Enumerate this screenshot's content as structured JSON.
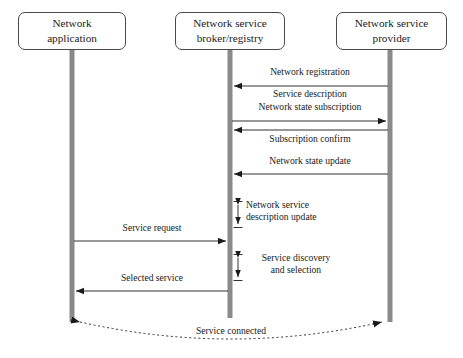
{
  "diagram": {
    "type": "sequence-diagram",
    "title": "",
    "background_color": "#ffffff",
    "lifeline_color": "#8a8a8a",
    "line_color": "#1a1a1a",
    "box_border_color": "#4a4a4a",
    "actors": [
      {
        "id": "network-application",
        "label": "Network\napplication",
        "box": {
          "x": 18,
          "y": 12,
          "width": 108,
          "height": 38
        },
        "lifeline_x": 72,
        "lifeline_top": 50,
        "lifeline_bottom": 322
      },
      {
        "id": "network-service-broker-registry",
        "label": "Network service\nbroker/registry",
        "box": {
          "x": 175,
          "y": 12,
          "width": 110,
          "height": 38
        },
        "lifeline_x": 230,
        "lifeline_top": 50,
        "lifeline_bottom": 318
      },
      {
        "id": "network-service-provider",
        "label": "Network service\nprovider",
        "box": {
          "x": 336,
          "y": 12,
          "width": 111,
          "height": 38
        },
        "lifeline_x": 390,
        "lifeline_top": 50,
        "lifeline_bottom": 322
      }
    ],
    "messages": [
      {
        "id": "network-registration",
        "label": "Network registration",
        "from": "network-service-provider",
        "to": "network-service-broker-registry",
        "direction": "right-to-left",
        "y": 86,
        "label_y": 72,
        "label_position": "above",
        "style": "solid"
      },
      {
        "id": "service-description",
        "label": "Service description",
        "from": "network-service-provider",
        "to": "network-service-broker-registry",
        "direction": "right-to-left",
        "y": 86,
        "label_y": 89,
        "label_position": "below",
        "style": "solid",
        "shares_line_with": "network-registration"
      },
      {
        "id": "network-state-subscription",
        "label": "Network state subscription",
        "from": "network-service-broker-registry",
        "to": "network-service-provider",
        "direction": "left-to-right",
        "y": 121,
        "label_y": 107,
        "label_position": "above",
        "style": "solid"
      },
      {
        "id": "subscription-confirm",
        "label": "Subscription confirm",
        "from": "network-service-provider",
        "to": "network-service-broker-registry",
        "direction": "right-to-left",
        "y": 130,
        "label_y": 134,
        "label_position": "below",
        "style": "solid"
      },
      {
        "id": "network-state-update",
        "label": "Network state update",
        "from": "network-service-provider",
        "to": "network-service-broker-registry",
        "direction": "right-to-left",
        "y": 174,
        "label_y": 160,
        "label_position": "above",
        "style": "solid"
      },
      {
        "id": "service-request",
        "label": "Service request",
        "from": "network-application",
        "to": "network-service-broker-registry",
        "direction": "left-to-right",
        "y": 241,
        "label_y": 227,
        "label_position": "above",
        "style": "solid"
      },
      {
        "id": "selected-service",
        "label": "Selected service",
        "from": "network-service-broker-registry",
        "to": "network-application",
        "direction": "right-to-left",
        "y": 291,
        "label_y": 277,
        "label_position": "above",
        "style": "solid"
      }
    ],
    "self_activities": [
      {
        "id": "network-service-description-update",
        "label": "Network service\ndescription update",
        "actor": "network-service-broker-registry",
        "arrow_x": 238,
        "y_top": 201,
        "y_bottom": 228,
        "label_x": 246,
        "label_y": 202,
        "arrow_type": "double-headed-vertical"
      },
      {
        "id": "service-discovery-and-selection",
        "label": "Service discovery\nand selection",
        "actor": "network-service-broker-registry",
        "arrow_x": 238,
        "y_top": 254,
        "y_bottom": 281,
        "label_x": 246,
        "label_y": 255,
        "arrow_type": "double-headed-vertical"
      }
    ],
    "connection": {
      "id": "service-connected",
      "label": "Service connected",
      "from": "network-application",
      "to": "network-service-provider",
      "direction": "bidirectional",
      "style": "dashed-curve",
      "start_x": 72,
      "end_x": 390,
      "y": 322,
      "curve_depth": 22,
      "label_x": 231,
      "label_y": 330
    }
  }
}
